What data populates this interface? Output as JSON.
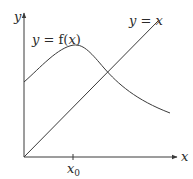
{
  "diagram": {
    "axes": {
      "x_label": "x",
      "y_label": "y",
      "tick_label_base": "x",
      "tick_label_sub": "0"
    },
    "curves": [
      {
        "name": "f",
        "label_lhs": "y",
        "label_eq": "=",
        "label_rhs_fn": "f(",
        "label_rhs_var": "x",
        "label_rhs_close": ")"
      },
      {
        "name": "identity",
        "label_lhs": "y",
        "label_eq": "=",
        "label_rhs": "x"
      }
    ],
    "colors": {
      "stroke": "#3a3a3a",
      "text": "#2a2a2a",
      "background": "#ffffff"
    }
  }
}
